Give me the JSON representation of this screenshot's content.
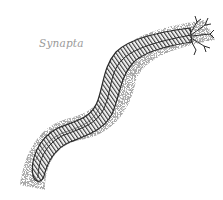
{
  "illustration": {
    "subject": "Synapta sea cucumber engraving",
    "label": "Synapta",
    "colors": {
      "ink": "#2a2a2a",
      "stipple": "#8c8c8c",
      "label": "#9a9a9a",
      "background": "#ffffff"
    }
  }
}
